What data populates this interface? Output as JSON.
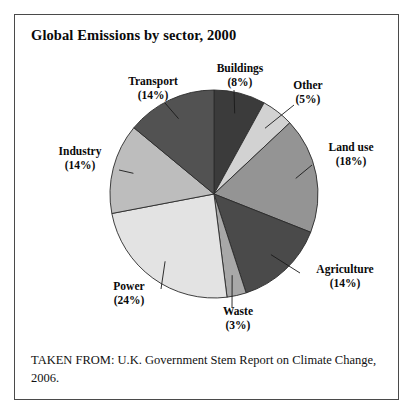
{
  "figure": {
    "title": "Global Emissions by sector, 2000",
    "source_note": "TAKEN FROM: U.K. Government Stem Report on Climate Change, 2006."
  },
  "chart_data": {
    "type": "pie",
    "title": "Global Emissions by sector, 2000",
    "xlabel": "",
    "ylabel": "",
    "units": "percent",
    "start_angle_deg": 0,
    "direction": "clockwise",
    "legend": "none",
    "grid": false,
    "categories": [
      "Buildings",
      "Other",
      "Land use",
      "Agriculture",
      "Waste",
      "Power",
      "Industry",
      "Transport"
    ],
    "values": [
      8,
      5,
      18,
      14,
      3,
      24,
      14,
      14
    ],
    "colors": [
      "#3b3b3b",
      "#d2d2d2",
      "#949494",
      "#4a4a4a",
      "#a8a8a8",
      "#e3e3e3",
      "#bdbdbd",
      "#525252"
    ],
    "slices": [
      {
        "label": "Buildings",
        "value": 8,
        "display": "Buildings\n(8%)",
        "pct_text": "(8%)",
        "color": "#3b3b3b"
      },
      {
        "label": "Other",
        "value": 5,
        "display": "Other\n(5%)",
        "pct_text": "(5%)",
        "color": "#d2d2d2"
      },
      {
        "label": "Land use",
        "value": 18,
        "display": "Land use\n(18%)",
        "pct_text": "(18%)",
        "color": "#949494"
      },
      {
        "label": "Agriculture",
        "value": 14,
        "display": "Agriculture\n(14%)",
        "pct_text": "(14%)",
        "color": "#4a4a4a"
      },
      {
        "label": "Waste",
        "value": 3,
        "display": "Waste\n(3%)",
        "pct_text": "(3%)",
        "color": "#a8a8a8"
      },
      {
        "label": "Power",
        "value": 24,
        "display": "Power\n(24%)",
        "pct_text": "(24%)",
        "color": "#e3e3e3"
      },
      {
        "label": "Industry",
        "value": 14,
        "display": "Industry\n(14%)",
        "pct_text": "(14%)",
        "color": "#bdbdbd"
      },
      {
        "label": "Transport",
        "value": 14,
        "display": "Transport\n(14%)",
        "pct_text": "(14%)",
        "color": "#525252"
      }
    ]
  },
  "labels": {
    "buildings": {
      "name": "Buildings",
      "pct": "(8%)"
    },
    "other": {
      "name": "Other",
      "pct": "(5%)"
    },
    "land_use": {
      "name": "Land use",
      "pct": "(18%)"
    },
    "agriculture": {
      "name": "Agriculture",
      "pct": "(14%)"
    },
    "waste": {
      "name": "Waste",
      "pct": "(3%)"
    },
    "power": {
      "name": "Power",
      "pct": "(24%)"
    },
    "industry": {
      "name": "Industry",
      "pct": "(14%)"
    },
    "transport": {
      "name": "Transport",
      "pct": "(14%)"
    }
  },
  "geometry": {
    "center_x": 199,
    "center_y": 179,
    "radius": 104
  }
}
